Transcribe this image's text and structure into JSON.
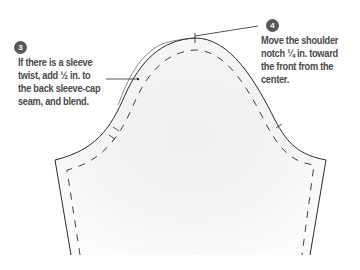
{
  "steps": [
    {
      "number": "3",
      "lines": [
        "If there is a sleeve",
        "twist, add ½ in. to",
        "the back sleeve-cap",
        "seam, and blend."
      ]
    },
    {
      "number": "4",
      "lines": [
        "Move the shoulder",
        "notch ¼ in. toward",
        "the front from the",
        "center."
      ]
    }
  ],
  "colors": {
    "badge": "#58595b",
    "text": "#4a4a4c",
    "line": "#2b2b2b",
    "fabric_shade": "#eeeeee"
  }
}
